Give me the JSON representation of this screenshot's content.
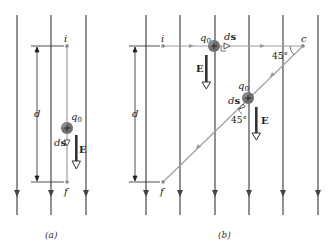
{
  "panels": [
    {
      "caption": "(a)",
      "labels": {
        "i": "i",
        "f": "f",
        "d": "d",
        "q0": "q",
        "q0_sub": "0",
        "ds_d": "d",
        "ds_s": "s",
        "E": "E"
      }
    },
    {
      "caption": "(b)",
      "labels": {
        "i": "i",
        "f": "f",
        "c": "c",
        "d": "d",
        "q0": "q",
        "q0_sub": "0",
        "ds_d": "d",
        "ds_s": "s",
        "E": "E",
        "angle_top": "45°",
        "angle_bottom": "45°"
      }
    }
  ],
  "colors": {
    "field_line": "#555555",
    "path": "#9a9a9a",
    "charge": "#666666",
    "arrow": "#333333"
  }
}
